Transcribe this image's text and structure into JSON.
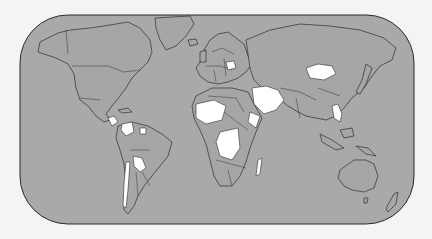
{
  "map": {
    "type": "world-choropleth",
    "projection": "rounded-rectangle world projection",
    "colors": {
      "background": "#f4f4f2",
      "ocean": "#a9a9a9",
      "land": "#a6a6a6",
      "border": "#2e2e2e",
      "highlight": "#ffffff"
    },
    "frame": {
      "x": 20,
      "y": 15,
      "width": 394,
      "height": 209,
      "corner_radius": 48
    },
    "highlighted_regions": [
      "Poland",
      "Mongolia",
      "Middle East (Syria/Iraq/Saudi Arabia/Iran region)",
      "Nicaragua / Central America",
      "Venezuela / Guyana",
      "Bolivia",
      "Chile",
      "West Africa (Sahel)",
      "Central Africa (DR Congo / Angola)",
      "Ethiopia / Somalia",
      "Mozambique",
      "Madagascar",
      "Indochina (Vietnam / Laos / Cambodia)"
    ]
  }
}
